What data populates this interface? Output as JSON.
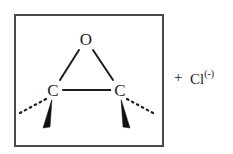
{
  "figure": {
    "name": "epoxide-plus-chloride",
    "background_color": "#ffffff",
    "stroke_color": "#1d1d1d",
    "frame": {
      "x": 14,
      "y": 14,
      "width": 150,
      "height": 133,
      "border_color": "#4a4a4a",
      "border_width": 2
    }
  },
  "molecule": {
    "name": "epoxide",
    "atoms": [
      {
        "id": "oxygen",
        "label": "O",
        "x": 86,
        "y": 40
      },
      {
        "id": "carbon-left",
        "label": "C",
        "x": 53,
        "y": 91
      },
      {
        "id": "carbon-right",
        "label": "C",
        "x": 120,
        "y": 91
      }
    ],
    "bonds": [
      {
        "id": "bond-o-cl",
        "type": "plain",
        "from": "oxygen",
        "to": "carbon-left"
      },
      {
        "id": "bond-o-cr",
        "type": "plain",
        "from": "oxygen",
        "to": "carbon-right"
      },
      {
        "id": "bond-cl-cr",
        "type": "plain",
        "from": "carbon-left",
        "to": "carbon-right"
      },
      {
        "id": "bond-cl-dashed",
        "type": "dashed",
        "from": "carbon-left",
        "direction": "down-left"
      },
      {
        "id": "bond-cl-wedge",
        "type": "wedge",
        "from": "carbon-left",
        "direction": "down"
      },
      {
        "id": "bond-cr-dashed",
        "type": "dashed",
        "from": "carbon-right",
        "direction": "down-right"
      },
      {
        "id": "bond-cr-wedge",
        "type": "wedge",
        "from": "carbon-right",
        "direction": "down"
      }
    ]
  },
  "reagent": {
    "plus": "+",
    "species": "Cl",
    "charge": "(-)"
  }
}
